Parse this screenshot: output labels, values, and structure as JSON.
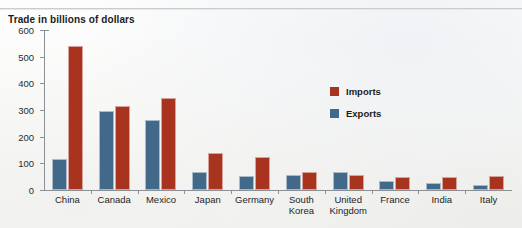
{
  "chart_data": {
    "type": "bar",
    "title": "Trade in billions of dollars",
    "xlabel": "",
    "ylabel": "",
    "ylim": [
      0,
      600
    ],
    "yticks": [
      0,
      100,
      200,
      300,
      400,
      500,
      600
    ],
    "grid": false,
    "legend_position": "inside-right",
    "categories": [
      "China",
      "Canada",
      "Mexico",
      "Japan",
      "Germany",
      "South\nKorea",
      "United\nKingdom",
      "France",
      "India",
      "Italy"
    ],
    "series": [
      {
        "name": "Imports",
        "color": "#a8341f",
        "values": [
          540,
          315,
          345,
          137,
          122,
          67,
          56,
          49,
          50,
          52
        ]
      },
      {
        "name": "Exports",
        "color": "#42688a",
        "values": [
          115,
          295,
          262,
          68,
          53,
          58,
          66,
          32,
          27,
          20
        ]
      }
    ]
  },
  "legend": {
    "items": [
      {
        "label": "Imports",
        "swatch": "imports-swatch"
      },
      {
        "label": "Exports",
        "swatch": "exports-swatch"
      }
    ]
  }
}
